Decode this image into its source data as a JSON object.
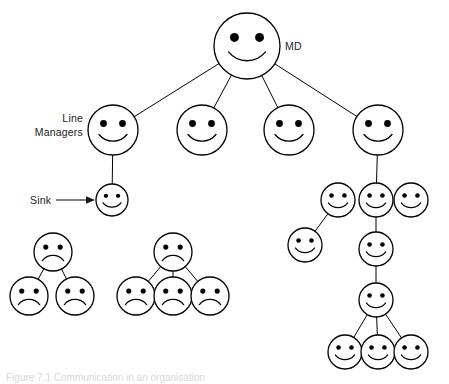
{
  "figure": {
    "background_color": "#ffffff",
    "stroke_color": "#000000",
    "label_color": "#1a1a1a",
    "width": 449,
    "height": 384
  },
  "labels": {
    "md": "MD",
    "line_managers_line1": "Line",
    "line_managers_line2": "Managers",
    "sink": "Sink"
  },
  "caption": {
    "text": "Figure 7.1 Communication in an organisation"
  },
  "chart_data": {
    "type": "diagram",
    "node_shape": "circle-face",
    "expressions": [
      "smile",
      "frown"
    ],
    "counts": {
      "total_nodes": 25,
      "smiling_nodes": 18,
      "frowning_nodes": 7,
      "labelled_nodes": 3,
      "disconnected_clusters": 2
    },
    "nodes": [
      {
        "id": "md",
        "label": "MD",
        "expression": "smile",
        "cx": 247,
        "cy": 46,
        "r": 33,
        "group": "top"
      },
      {
        "id": "lm1",
        "label": "",
        "expression": "smile",
        "cx": 113,
        "cy": 130,
        "r": 25,
        "group": "line-managers"
      },
      {
        "id": "lm2",
        "label": "",
        "expression": "smile",
        "cx": 202,
        "cy": 130,
        "r": 25,
        "group": "line-managers"
      },
      {
        "id": "lm3",
        "label": "",
        "expression": "smile",
        "cx": 289,
        "cy": 130,
        "r": 25,
        "group": "line-managers"
      },
      {
        "id": "lm4",
        "label": "",
        "expression": "smile",
        "cx": 378,
        "cy": 130,
        "r": 25,
        "group": "line-managers"
      },
      {
        "id": "sink",
        "label": "Sink",
        "expression": "smile",
        "cx": 112,
        "cy": 200,
        "r": 16,
        "group": "sink"
      },
      {
        "id": "r-a1",
        "label": "",
        "expression": "smile",
        "cx": 338,
        "cy": 200,
        "r": 17,
        "group": "right-branch"
      },
      {
        "id": "r-a2",
        "label": "",
        "expression": "smile",
        "cx": 376,
        "cy": 200,
        "r": 17,
        "group": "right-branch"
      },
      {
        "id": "r-a3",
        "label": "",
        "expression": "smile",
        "cx": 411,
        "cy": 200,
        "r": 17,
        "group": "right-branch"
      },
      {
        "id": "r-b1",
        "label": "",
        "expression": "smile",
        "cx": 305,
        "cy": 245,
        "r": 17,
        "group": "right-branch"
      },
      {
        "id": "r-b2",
        "label": "",
        "expression": "smile",
        "cx": 376,
        "cy": 249,
        "r": 17,
        "group": "right-branch"
      },
      {
        "id": "r-c1",
        "label": "",
        "expression": "smile",
        "cx": 376,
        "cy": 300,
        "r": 17,
        "group": "right-branch"
      },
      {
        "id": "r-d1",
        "label": "",
        "expression": "smile",
        "cx": 345,
        "cy": 352,
        "r": 17,
        "group": "right-branch"
      },
      {
        "id": "r-d2",
        "label": "",
        "expression": "smile",
        "cx": 378,
        "cy": 352,
        "r": 17,
        "group": "right-branch"
      },
      {
        "id": "r-d3",
        "label": "",
        "expression": "smile",
        "cx": 411,
        "cy": 352,
        "r": 17,
        "group": "right-branch"
      },
      {
        "id": "sadA-top",
        "label": "",
        "expression": "frown",
        "cx": 53,
        "cy": 252,
        "r": 19,
        "group": "sad-cluster-left"
      },
      {
        "id": "sadA-c1",
        "label": "",
        "expression": "frown",
        "cx": 29,
        "cy": 296,
        "r": 19,
        "group": "sad-cluster-left"
      },
      {
        "id": "sadA-c2",
        "label": "",
        "expression": "frown",
        "cx": 75,
        "cy": 296,
        "r": 19,
        "group": "sad-cluster-left"
      },
      {
        "id": "sadB-top",
        "label": "",
        "expression": "frown",
        "cx": 173,
        "cy": 252,
        "r": 19,
        "group": "sad-cluster-middle"
      },
      {
        "id": "sadB-c1",
        "label": "",
        "expression": "frown",
        "cx": 136,
        "cy": 296,
        "r": 19,
        "group": "sad-cluster-middle"
      },
      {
        "id": "sadB-c2",
        "label": "",
        "expression": "frown",
        "cx": 173,
        "cy": 296,
        "r": 19,
        "group": "sad-cluster-middle"
      },
      {
        "id": "sadB-c3",
        "label": "",
        "expression": "frown",
        "cx": 210,
        "cy": 296,
        "r": 19,
        "group": "sad-cluster-middle"
      }
    ],
    "edges": [
      {
        "from": "md",
        "to": "lm1"
      },
      {
        "from": "md",
        "to": "lm2"
      },
      {
        "from": "md",
        "to": "lm3"
      },
      {
        "from": "md",
        "to": "lm4"
      },
      {
        "from": "lm1",
        "to": "sink"
      },
      {
        "from": "lm4",
        "to": "r-a2"
      },
      {
        "from": "r-a1",
        "to": "r-b1"
      },
      {
        "from": "r-a2",
        "to": "r-b2"
      },
      {
        "from": "r-b2",
        "to": "r-c1"
      },
      {
        "from": "r-c1",
        "to": "r-d1"
      },
      {
        "from": "r-c1",
        "to": "r-d2"
      },
      {
        "from": "r-c1",
        "to": "r-d3"
      },
      {
        "from": "sadA-top",
        "to": "sadA-c1"
      },
      {
        "from": "sadA-top",
        "to": "sadA-c2"
      },
      {
        "from": "sadB-top",
        "to": "sadB-c1"
      },
      {
        "from": "sadB-top",
        "to": "sadB-c2"
      },
      {
        "from": "sadB-top",
        "to": "sadB-c3"
      }
    ],
    "annotations": [
      {
        "id": "md-label",
        "text": "MD",
        "x": 285,
        "y": 50,
        "anchor": "start",
        "target": "md"
      },
      {
        "id": "line-managers-label",
        "text": "Line Managers",
        "x": 83,
        "y": 126,
        "anchor": "end",
        "target": "lm1"
      },
      {
        "id": "sink-label",
        "text": "Sink",
        "x": 32,
        "y": 204,
        "anchor": "start",
        "target": "sink",
        "connector": "arrow"
      }
    ]
  }
}
